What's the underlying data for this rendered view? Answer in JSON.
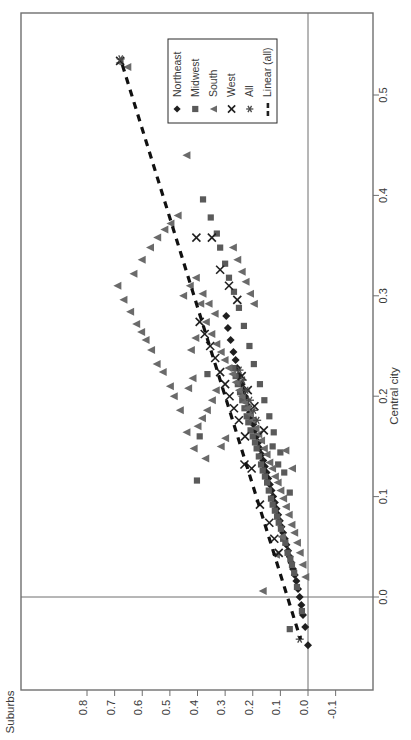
{
  "chart_data": {
    "type": "scatter",
    "title": "",
    "orientation": "rotated-90-ccw",
    "xlabel": "Suburbs",
    "ylabel": "Central city",
    "xlim": [
      0.87,
      -0.145
    ],
    "ylim": [
      -0.055,
      0.565
    ],
    "xticks": [
      0.8,
      0.7,
      0.6,
      0.5,
      0.4,
      0.3,
      0.2,
      0.1,
      0.0,
      -0.1
    ],
    "xtick_labels": [
      "0.8",
      "0.7",
      "0.6",
      "0.5",
      "0.4",
      "0.3",
      "0.2",
      "0.1",
      "0.0",
      "-0.1"
    ],
    "yticks": [
      0.0,
      0.1,
      0.2,
      0.3,
      0.4,
      0.5
    ],
    "ytick_labels": [
      "0.0",
      "0.1",
      "0.2",
      "0.3",
      "0.4",
      "0.5"
    ],
    "grid": false,
    "zero_lines": {
      "x": 0.0,
      "y": 0.0
    },
    "legend_position": "top-center",
    "marker_color": "#4a4a4a",
    "line_color": "#111111",
    "axis_color": "#6f6f6f",
    "series": [
      {
        "name": "Northeast",
        "marker": "diamond",
        "points": [
          [
            0.0,
            -0.048
          ],
          [
            0.01,
            -0.03
          ],
          [
            0.018,
            -0.018
          ],
          [
            0.024,
            -0.008
          ],
          [
            0.03,
            0.0
          ],
          [
            0.036,
            0.008
          ],
          [
            0.042,
            0.016
          ],
          [
            0.048,
            0.022
          ],
          [
            0.054,
            0.028
          ],
          [
            0.06,
            0.034
          ],
          [
            0.066,
            0.04
          ],
          [
            0.072,
            0.046
          ],
          [
            0.078,
            0.052
          ],
          [
            0.084,
            0.058
          ],
          [
            0.09,
            0.064
          ],
          [
            0.096,
            0.07
          ],
          [
            0.102,
            0.076
          ],
          [
            0.108,
            0.082
          ],
          [
            0.114,
            0.088
          ],
          [
            0.12,
            0.094
          ],
          [
            0.126,
            0.1
          ],
          [
            0.132,
            0.106
          ],
          [
            0.138,
            0.112
          ],
          [
            0.144,
            0.118
          ],
          [
            0.15,
            0.124
          ],
          [
            0.156,
            0.13
          ],
          [
            0.162,
            0.136
          ],
          [
            0.168,
            0.142
          ],
          [
            0.174,
            0.148
          ],
          [
            0.18,
            0.154
          ],
          [
            0.186,
            0.16
          ],
          [
            0.192,
            0.166
          ],
          [
            0.198,
            0.172
          ],
          [
            0.204,
            0.178
          ],
          [
            0.21,
            0.184
          ],
          [
            0.216,
            0.19
          ],
          [
            0.222,
            0.196
          ],
          [
            0.228,
            0.2
          ],
          [
            0.234,
            0.206
          ],
          [
            0.24,
            0.212
          ],
          [
            0.248,
            0.22
          ],
          [
            0.256,
            0.228
          ],
          [
            0.262,
            0.236
          ],
          [
            0.27,
            0.244
          ],
          [
            0.28,
            0.256
          ],
          [
            0.29,
            0.268
          ],
          [
            0.296,
            0.28
          ]
        ]
      },
      {
        "name": "Midwest",
        "marker": "square",
        "points": [
          [
            0.022,
            -0.014
          ],
          [
            0.04,
            0.01
          ],
          [
            0.05,
            0.024
          ],
          [
            0.058,
            0.032
          ],
          [
            0.064,
            0.038
          ],
          [
            0.074,
            0.044
          ],
          [
            0.082,
            0.054
          ],
          [
            0.09,
            0.058
          ],
          [
            0.098,
            0.068
          ],
          [
            0.106,
            0.074
          ],
          [
            0.112,
            0.08
          ],
          [
            0.12,
            0.086
          ],
          [
            0.128,
            0.092
          ],
          [
            0.134,
            0.098
          ],
          [
            0.142,
            0.106
          ],
          [
            0.148,
            0.114
          ],
          [
            0.156,
            0.12
          ],
          [
            0.164,
            0.126
          ],
          [
            0.17,
            0.132
          ],
          [
            0.178,
            0.14
          ],
          [
            0.186,
            0.148
          ],
          [
            0.192,
            0.154
          ],
          [
            0.2,
            0.16
          ],
          [
            0.208,
            0.166
          ],
          [
            0.216,
            0.174
          ],
          [
            0.222,
            0.18
          ],
          [
            0.23,
            0.188
          ],
          [
            0.238,
            0.196
          ],
          [
            0.246,
            0.204
          ],
          [
            0.254,
            0.212
          ],
          [
            0.262,
            0.22
          ],
          [
            0.27,
            0.228
          ],
          [
            0.1,
            0.144
          ],
          [
            0.124,
            0.164
          ],
          [
            0.14,
            0.18
          ],
          [
            0.158,
            0.196
          ],
          [
            0.174,
            0.212
          ],
          [
            0.196,
            0.232
          ],
          [
            0.212,
            0.25
          ],
          [
            0.232,
            0.27
          ],
          [
            0.25,
            0.288
          ],
          [
            0.268,
            0.304
          ],
          [
            0.286,
            0.318
          ],
          [
            0.3,
            0.332
          ],
          [
            0.066,
            0.104
          ],
          [
            0.086,
            0.124
          ],
          [
            0.108,
            0.132
          ],
          [
            0.128,
            0.15
          ],
          [
            0.364,
            0.222
          ],
          [
            0.392,
            0.16
          ],
          [
            0.402,
            0.116
          ],
          [
            0.066,
            -0.032
          ],
          [
            0.318,
            0.348
          ],
          [
            0.33,
            0.362
          ],
          [
            0.352,
            0.378
          ],
          [
            0.38,
            0.396
          ]
        ]
      },
      {
        "name": "South",
        "marker": "triangle",
        "points": [
          [
            0.372,
            0.138
          ],
          [
            0.414,
            0.148
          ],
          [
            0.44,
            0.164
          ],
          [
            0.464,
            0.186
          ],
          [
            0.486,
            0.2
          ],
          [
            0.5,
            0.21
          ],
          [
            0.526,
            0.224
          ],
          [
            0.548,
            0.232
          ],
          [
            0.568,
            0.246
          ],
          [
            0.588,
            0.256
          ],
          [
            0.604,
            0.264
          ],
          [
            0.622,
            0.272
          ],
          [
            0.644,
            0.284
          ],
          [
            0.668,
            0.296
          ],
          [
            0.69,
            0.31
          ],
          [
            0.44,
            0.44
          ],
          [
            0.682,
            0.532
          ],
          [
            0.654,
            0.528
          ],
          [
            0.632,
            0.322
          ],
          [
            0.602,
            0.336
          ],
          [
            0.572,
            0.348
          ],
          [
            0.546,
            0.358
          ],
          [
            0.52,
            0.366
          ],
          [
            0.498,
            0.372
          ],
          [
            0.472,
            0.38
          ],
          [
            0.452,
            0.3
          ],
          [
            0.428,
            0.31
          ],
          [
            0.406,
            0.318
          ],
          [
            0.39,
            0.292
          ],
          [
            0.37,
            0.274
          ],
          [
            0.35,
            0.262
          ],
          [
            0.332,
            0.252
          ],
          [
            0.316,
            0.244
          ],
          [
            0.302,
            0.236
          ],
          [
            0.288,
            0.228
          ],
          [
            0.274,
            0.222
          ],
          [
            0.262,
            0.214
          ],
          [
            0.25,
            0.206
          ],
          [
            0.24,
            0.2
          ],
          [
            0.23,
            0.194
          ],
          [
            0.22,
            0.188
          ],
          [
            0.21,
            0.182
          ],
          [
            0.2,
            0.176
          ],
          [
            0.19,
            0.168
          ],
          [
            0.18,
            0.162
          ],
          [
            0.17,
            0.156
          ],
          [
            0.16,
            0.148
          ],
          [
            0.15,
            0.142
          ],
          [
            0.14,
            0.134
          ],
          [
            0.13,
            0.128
          ],
          [
            0.12,
            0.12
          ],
          [
            0.11,
            0.114
          ],
          [
            0.1,
            0.106
          ],
          [
            0.09,
            0.098
          ],
          [
            0.08,
            0.09
          ],
          [
            0.07,
            0.082
          ],
          [
            0.06,
            0.072
          ],
          [
            0.05,
            0.064
          ],
          [
            0.04,
            0.054
          ],
          [
            0.03,
            0.044
          ],
          [
            0.02,
            0.032
          ],
          [
            0.01,
            0.02
          ],
          [
            0.334,
            0.206
          ],
          [
            0.348,
            0.196
          ],
          [
            0.366,
            0.186
          ],
          [
            0.384,
            0.178
          ],
          [
            0.4,
            0.17
          ],
          [
            0.3,
            0.158
          ],
          [
            0.316,
            0.15
          ],
          [
            0.338,
            0.282
          ],
          [
            0.36,
            0.292
          ],
          [
            0.382,
            0.302
          ],
          [
            0.408,
            0.258
          ],
          [
            0.424,
            0.246
          ],
          [
            0.116,
            0.042
          ],
          [
            0.164,
            0.006
          ],
          [
            0.096,
            0.06
          ],
          [
            0.058,
            0.128
          ],
          [
            0.082,
            0.146
          ],
          [
            0.272,
            0.348
          ],
          [
            0.256,
            0.336
          ],
          [
            0.24,
            0.324
          ],
          [
            0.226,
            0.314
          ],
          [
            0.21,
            0.302
          ],
          [
            0.196,
            0.292
          ],
          [
            0.418,
            0.218
          ],
          [
            0.434,
            0.208
          ]
        ]
      },
      {
        "name": "West",
        "marker": "cross",
        "points": [
          [
            0.14,
            0.074
          ],
          [
            0.174,
            0.092
          ],
          [
            0.204,
            0.128
          ],
          [
            0.228,
            0.16
          ],
          [
            0.25,
            0.176
          ],
          [
            0.268,
            0.188
          ],
          [
            0.284,
            0.2
          ],
          [
            0.3,
            0.212
          ],
          [
            0.318,
            0.224
          ],
          [
            0.336,
            0.238
          ],
          [
            0.354,
            0.25
          ],
          [
            0.374,
            0.262
          ],
          [
            0.392,
            0.274
          ],
          [
            0.256,
            0.296
          ],
          [
            0.286,
            0.31
          ],
          [
            0.318,
            0.326
          ],
          [
            0.348,
            0.358
          ],
          [
            0.404,
            0.358
          ],
          [
            0.194,
            0.19
          ],
          [
            0.218,
            0.206
          ],
          [
            0.24,
            0.22
          ],
          [
            0.16,
            0.166
          ],
          [
            0.68,
            0.534
          ],
          [
            0.122,
            0.058
          ],
          [
            0.106,
            0.044
          ],
          [
            0.23,
            0.132
          ]
        ]
      },
      {
        "name": "All",
        "marker": "asterisk",
        "points": [
          [
            0.21,
            0.196
          ],
          [
            0.224,
            0.206
          ],
          [
            0.196,
            0.186
          ],
          [
            0.236,
            0.216
          ],
          [
            0.678,
            0.536
          ],
          [
            0.03,
            -0.042
          ],
          [
            0.184,
            0.176
          ],
          [
            0.248,
            0.226
          ]
        ]
      }
    ],
    "trendline": {
      "name": "Linear (all)",
      "style": "dashed",
      "endpoints": [
        [
          0.672,
          0.53
        ],
        [
          0.027,
          -0.042
        ]
      ]
    }
  },
  "legend": {
    "entries": [
      {
        "label": "Northeast",
        "marker": "diamond"
      },
      {
        "label": "Midwest",
        "marker": "square"
      },
      {
        "label": "South",
        "marker": "triangle"
      },
      {
        "label": "West",
        "marker": "cross"
      },
      {
        "label": "All",
        "marker": "asterisk"
      },
      {
        "label": "Linear (all)",
        "marker": "dashed-line"
      }
    ]
  }
}
